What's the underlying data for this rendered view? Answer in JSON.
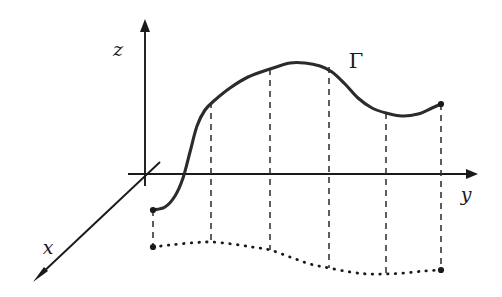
{
  "figure": {
    "background_color": "#ffffff",
    "curve_color": "#2b2b2b",
    "axis_color": "#1a1a1a",
    "width": 502,
    "height": 297
  },
  "labels": {
    "z_axis": "z",
    "y_axis": "y",
    "x_axis": "x",
    "curve": "Γ"
  },
  "axes": {
    "origin": {
      "x": 145,
      "y": 174
    },
    "z": {
      "from": {
        "x": 145,
        "y": 186
      },
      "to": {
        "x": 145,
        "y": 20
      },
      "label_pos": {
        "x": 121,
        "y": 55
      }
    },
    "y": {
      "from": {
        "x": 128,
        "y": 174
      },
      "to": {
        "x": 478,
        "y": 174
      },
      "label_pos": {
        "x": 464,
        "y": 199
      }
    },
    "x": {
      "from": {
        "x": 160,
        "y": 162
      },
      "to": {
        "x": 33,
        "y": 282
      },
      "label_pos": {
        "x": 45,
        "y": 252
      }
    }
  },
  "chart_data": {
    "type": "line",
    "title": "",
    "xlabel": "y",
    "ylabel": "z",
    "grid": false,
    "legend": null,
    "annotations": [
      {
        "text": "Γ",
        "x": 355,
        "y": 62,
        "note": "curve name label"
      }
    ],
    "series": [
      {
        "name": "Γ (space curve)",
        "style": "solid",
        "color": "#2b2b2b",
        "points": [
          {
            "x": 153,
            "y": 210
          },
          {
            "x": 165,
            "y": 207
          },
          {
            "x": 175,
            "y": 196
          },
          {
            "x": 183,
            "y": 178
          },
          {
            "x": 190,
            "y": 152
          },
          {
            "x": 197,
            "y": 126
          },
          {
            "x": 205,
            "y": 110
          },
          {
            "x": 215,
            "y": 100
          },
          {
            "x": 230,
            "y": 88
          },
          {
            "x": 248,
            "y": 77
          },
          {
            "x": 270,
            "y": 69
          },
          {
            "x": 290,
            "y": 63
          },
          {
            "x": 305,
            "y": 63
          },
          {
            "x": 320,
            "y": 66
          },
          {
            "x": 332,
            "y": 72
          },
          {
            "x": 345,
            "y": 84
          },
          {
            "x": 358,
            "y": 98
          },
          {
            "x": 372,
            "y": 108
          },
          {
            "x": 386,
            "y": 113
          },
          {
            "x": 402,
            "y": 116
          },
          {
            "x": 418,
            "y": 114
          },
          {
            "x": 432,
            "y": 108
          },
          {
            "x": 441,
            "y": 104
          }
        ]
      },
      {
        "name": "projection onto xy-plane",
        "style": "dotted",
        "color": "#1a1a1a",
        "points": [
          {
            "x": 153,
            "y": 247
          },
          {
            "x": 170,
            "y": 245
          },
          {
            "x": 190,
            "y": 243
          },
          {
            "x": 210,
            "y": 242
          },
          {
            "x": 232,
            "y": 244
          },
          {
            "x": 252,
            "y": 247
          },
          {
            "x": 270,
            "y": 250
          },
          {
            "x": 290,
            "y": 257
          },
          {
            "x": 310,
            "y": 264
          },
          {
            "x": 329,
            "y": 268
          },
          {
            "x": 350,
            "y": 272
          },
          {
            "x": 368,
            "y": 274
          },
          {
            "x": 386,
            "y": 274
          },
          {
            "x": 405,
            "y": 273
          },
          {
            "x": 424,
            "y": 271
          },
          {
            "x": 441,
            "y": 270
          }
        ]
      }
    ],
    "drop_lines": [
      {
        "x": 153,
        "y_top": 210,
        "y_bottom": 247
      },
      {
        "x": 211,
        "y_top": 102,
        "y_bottom": 242
      },
      {
        "x": 270,
        "y_top": 69,
        "y_bottom": 250
      },
      {
        "x": 329,
        "y_top": 67,
        "y_bottom": 268
      },
      {
        "x": 386,
        "y_top": 113,
        "y_bottom": 274
      },
      {
        "x": 441,
        "y_top": 104,
        "y_bottom": 270
      }
    ],
    "endpoints": [
      {
        "x": 153,
        "y": 210,
        "which": "curve-start"
      },
      {
        "x": 441,
        "y": 104,
        "which": "curve-end"
      },
      {
        "x": 153,
        "y": 247,
        "which": "projection-start"
      },
      {
        "x": 441,
        "y": 270,
        "which": "projection-end"
      }
    ]
  }
}
